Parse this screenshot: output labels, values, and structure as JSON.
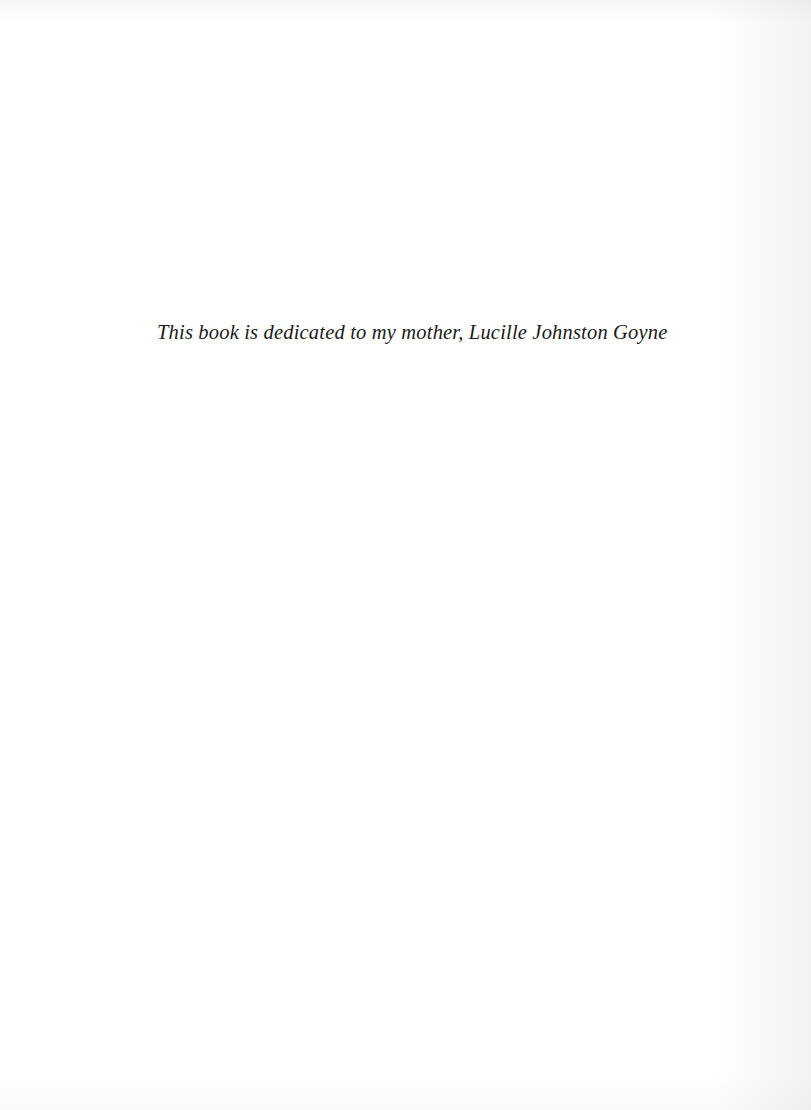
{
  "page": {
    "kind": "book-dedication-page",
    "background_color": "#ffffff",
    "ink_color": "#1a1a1a",
    "width": 811,
    "height": 1110
  },
  "dedication": {
    "text": "This book is dedicated to my mother, Lucille Johnston Goyne"
  }
}
